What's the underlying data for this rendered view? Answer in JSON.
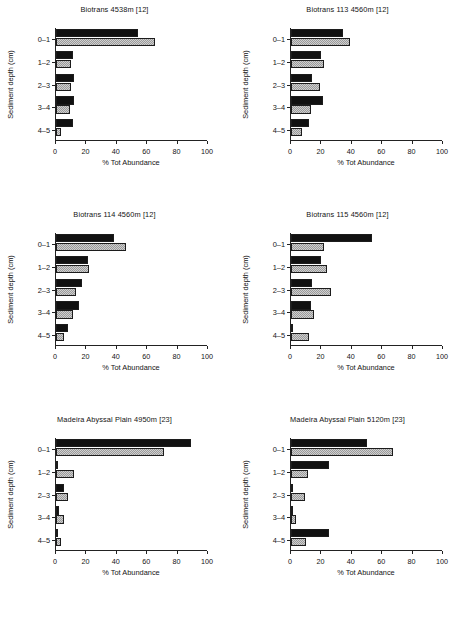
{
  "figure": {
    "caption_fragment": "",
    "bar_legend": {
      "series_black": "black-solid",
      "series_gray": "gray-stippled"
    }
  },
  "axes": {
    "xlabel": "% Tot Abundance",
    "ylabel": "Sediment depth (cm)",
    "xticks": [
      "0",
      "20",
      "40",
      "60",
      "80",
      "100"
    ],
    "categories": [
      "0–1",
      "1–2",
      "2–3",
      "3–4",
      "4–5"
    ],
    "xlim": [
      0,
      100
    ]
  },
  "chart_data": [
    {
      "type": "bar",
      "title": "Biotrans 4538m [12]",
      "xlabel": "% Tot Abundance",
      "ylabel": "Sediment depth (cm)",
      "categories": [
        "0–1",
        "1–2",
        "2–3",
        "3–4",
        "4–5"
      ],
      "xlim": [
        0,
        100
      ],
      "grid": false,
      "series": [
        {
          "name": "black-solid",
          "values": [
            54,
            11,
            12,
            12,
            11
          ]
        },
        {
          "name": "gray-stippled",
          "values": [
            65,
            10,
            10,
            9,
            3
          ]
        }
      ]
    },
    {
      "type": "bar",
      "title": "Biotrans 113 4560m [12]",
      "xlabel": "% Tot Abundance",
      "ylabel": "Sediment depth (cm)",
      "categories": [
        "0–1",
        "1–2",
        "2–3",
        "3–4",
        "4–5"
      ],
      "xlim": [
        0,
        100
      ],
      "grid": false,
      "series": [
        {
          "name": "black-solid",
          "values": [
            34,
            20,
            14,
            21,
            12
          ]
        },
        {
          "name": "gray-stippled",
          "values": [
            39,
            22,
            19,
            13,
            7
          ]
        }
      ]
    },
    {
      "type": "bar",
      "title": "Biotrans 114 4560m [12]",
      "xlabel": "% Tot Abundance",
      "ylabel": "Sediment depth (cm)",
      "categories": [
        "0–1",
        "1–2",
        "2–3",
        "3–4",
        "4–5"
      ],
      "xlim": [
        0,
        100
      ],
      "grid": false,
      "series": [
        {
          "name": "black-solid",
          "values": [
            38,
            21,
            17,
            15,
            8
          ]
        },
        {
          "name": "gray-stippled",
          "values": [
            46,
            22,
            13,
            11,
            5
          ]
        }
      ]
    },
    {
      "type": "bar",
      "title": "Biotrans 115 4560m [12]",
      "xlabel": "% Tot Abundance",
      "ylabel": "Sediment depth (cm)",
      "categories": [
        "0–1",
        "1–2",
        "2–3",
        "3–4",
        "4–5"
      ],
      "xlim": [
        0,
        100
      ],
      "grid": false,
      "series": [
        {
          "name": "black-solid",
          "values": [
            53,
            20,
            14,
            13,
            0
          ]
        },
        {
          "name": "gray-stippled",
          "values": [
            22,
            24,
            26,
            15,
            12
          ]
        }
      ]
    },
    {
      "type": "bar",
      "title": "Madeira Abyssal Plain 4950m [23]",
      "xlabel": "% Tot Abundance",
      "ylabel": "Sediment depth (cm)",
      "categories": [
        "0–1",
        "1–2",
        "2–3",
        "3–4",
        "4–5"
      ],
      "xlim": [
        0,
        100
      ],
      "grid": false,
      "series": [
        {
          "name": "black-solid",
          "values": [
            89,
            1,
            5,
            2,
            0
          ]
        },
        {
          "name": "gray-stippled",
          "values": [
            71,
            12,
            8,
            5,
            3
          ]
        }
      ]
    },
    {
      "type": "bar",
      "title": "Madeira Abyssal Plain 5120m [23]",
      "xlabel": "% Tot Abundance",
      "ylabel": "Sediment depth (cm)",
      "categories": [
        "0–1",
        "1–2",
        "2–3",
        "3–4",
        "4–5"
      ],
      "xlim": [
        0,
        100
      ],
      "grid": false,
      "series": [
        {
          "name": "black-solid",
          "values": [
            50,
            25,
            0,
            1,
            25
          ]
        },
        {
          "name": "gray-stippled",
          "values": [
            67,
            11,
            9,
            3,
            10
          ]
        }
      ]
    }
  ]
}
